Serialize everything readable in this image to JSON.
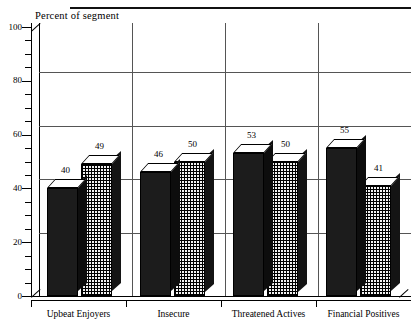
{
  "chart_data": {
    "type": "bar",
    "title": "",
    "ylabel": "Percent of segment",
    "xlabel": "",
    "ylim": [
      0,
      100
    ],
    "ytick_labels": [
      "0",
      "20",
      "40",
      "60",
      "80",
      "100"
    ],
    "ytick_values": [
      0,
      20,
      40,
      60,
      80,
      100
    ],
    "minor_tick_step": 5,
    "gridlines": [
      20,
      40,
      60,
      80
    ],
    "grid": true,
    "legend": "none",
    "categories": [
      "Upbeat Enjoyers",
      "Insecure",
      "Threatened Actives",
      "Financial Positives"
    ],
    "series": [
      {
        "name": "series-1",
        "style": "solid-dark",
        "values": [
          40,
          46,
          53,
          55
        ]
      },
      {
        "name": "series-2",
        "style": "cross-hatch",
        "values": [
          49,
          50,
          50,
          41
        ]
      }
    ]
  },
  "axis": {
    "title": "Percent of segment"
  }
}
